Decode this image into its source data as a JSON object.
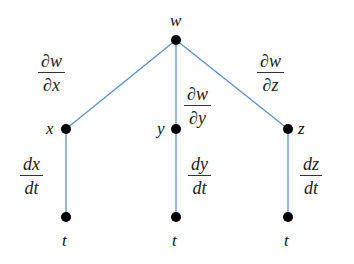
{
  "diagram": {
    "type": "tree",
    "colors": {
      "edge": "#5b8ec9",
      "node": "#000000",
      "text": "#222222"
    },
    "nodes": {
      "w": {
        "label": "w",
        "x": 176,
        "y": 40
      },
      "x": {
        "label": "x",
        "x": 66,
        "y": 129
      },
      "y": {
        "label": "y",
        "x": 176,
        "y": 129
      },
      "z": {
        "label": "z",
        "x": 288,
        "y": 129
      },
      "t1": {
        "label": "t",
        "x": 66,
        "y": 217
      },
      "t2": {
        "label": "t",
        "x": 176,
        "y": 217
      },
      "t3": {
        "label": "t",
        "x": 288,
        "y": 217
      }
    },
    "edges": [
      {
        "from": "w",
        "to": "x",
        "label": {
          "num": "∂w",
          "den": "∂x"
        }
      },
      {
        "from": "w",
        "to": "y",
        "label": {
          "num": "∂w",
          "den": "∂y"
        }
      },
      {
        "from": "w",
        "to": "z",
        "label": {
          "num": "∂w",
          "den": "∂z"
        }
      },
      {
        "from": "x",
        "to": "t1",
        "label": {
          "num": "dx",
          "den": "dt"
        }
      },
      {
        "from": "y",
        "to": "t2",
        "label": {
          "num": "dy",
          "den": "dt"
        }
      },
      {
        "from": "z",
        "to": "t3",
        "label": {
          "num": "dz",
          "den": "dt"
        }
      }
    ]
  }
}
